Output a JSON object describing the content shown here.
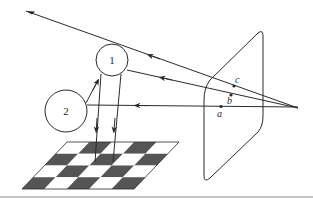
{
  "diagram": {
    "colors": {
      "stroke": "#2a2a2a",
      "dark_square": "#555555",
      "light_square": "#ffffff",
      "rule": "#888888"
    },
    "objects": [
      {
        "id": "sphere-1",
        "label": "1"
      },
      {
        "id": "sphere-2",
        "label": "2"
      }
    ],
    "image_plane_points": [
      {
        "id": "point-a",
        "label": "a"
      },
      {
        "id": "point-b",
        "label": "b"
      },
      {
        "id": "point-c",
        "label": "c"
      }
    ],
    "checkerboard": {
      "rows": 4,
      "cols": 5
    }
  }
}
